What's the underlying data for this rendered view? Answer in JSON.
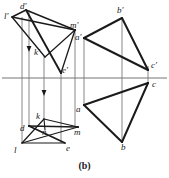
{
  "figure": {
    "caption": "(b)",
    "colors": {
      "ink": "#1a1a1a",
      "thin_line": "#555555",
      "ground_line": "#777777",
      "background": "#ffffff"
    },
    "ground_line": {
      "name": "XY ground line",
      "y": 78,
      "x1": 2,
      "x2": 167
    },
    "labels": [
      {
        "id": "d-prime",
        "text": "d'",
        "x": 20,
        "y": 4
      },
      {
        "id": "l-prime",
        "text": "l'",
        "x": 5,
        "y": 14
      },
      {
        "id": "m-prime",
        "text": "m'",
        "x": 71,
        "y": 24
      },
      {
        "id": "a-prime",
        "text": "a'",
        "x": 76,
        "y": 36
      },
      {
        "id": "b-prime",
        "text": "b'",
        "x": 117,
        "y": 8
      },
      {
        "id": "c-prime",
        "text": "c'",
        "x": 150,
        "y": 63
      },
      {
        "id": "k-prime",
        "text": "k'",
        "x": 35,
        "y": 51
      },
      {
        "id": "e-prime",
        "text": "e'",
        "x": 62,
        "y": 68
      },
      {
        "id": "c",
        "text": "c",
        "x": 151,
        "y": 82
      },
      {
        "id": "a",
        "text": "a",
        "x": 77,
        "y": 107
      },
      {
        "id": "b",
        "text": "b",
        "x": 122,
        "y": 145
      },
      {
        "id": "k",
        "text": "k",
        "x": 36,
        "y": 117
      },
      {
        "id": "d",
        "text": "d",
        "x": 21,
        "y": 127
      },
      {
        "id": "n",
        "text": "n",
        "x": 42,
        "y": 130
      },
      {
        "id": "m",
        "text": "m",
        "x": 72,
        "y": 130
      },
      {
        "id": "l",
        "text": "l",
        "x": 14,
        "y": 148
      },
      {
        "id": "e",
        "text": "e",
        "x": 66,
        "y": 146
      }
    ],
    "geometry": {
      "front_view_plane": {
        "name": "front view of plane figure d'l'm'e'",
        "points": "25,10 61,73 75,30 25,10"
      },
      "front_view_edges": [
        {
          "name": "edge-l-prime-to-m-prime",
          "x1": 12,
          "y1": 17,
          "x2": 75,
          "y2": 30
        },
        {
          "name": "edge-d-prime-to-e-prime",
          "x1": 25,
          "y1": 10,
          "x2": 61,
          "y2": 73
        },
        {
          "name": "edge-e-prime-to-m-prime",
          "x1": 61,
          "y1": 73,
          "x2": 75,
          "y2": 30
        },
        {
          "name": "edge-d-prime-to-m-prime",
          "x1": 25,
          "y1": 10,
          "x2": 75,
          "y2": 30
        },
        {
          "name": "edge-l-prime-to-d-prime",
          "x1": 12,
          "y1": 17,
          "x2": 25,
          "y2": 10
        },
        {
          "name": "edge-l-prime-to-k-prime",
          "x1": 12,
          "y1": 17,
          "x2": 44,
          "y2": 56
        }
      ],
      "top_view_plane": {
        "name": "top view of plane figure d l m e",
        "edges": [
          {
            "name": "edge-d-to-m",
            "x1": 29,
            "y1": 127,
            "x2": 78,
            "y2": 127
          },
          {
            "name": "edge-d-to-e",
            "x1": 29,
            "y1": 127,
            "x2": 65,
            "y2": 143
          },
          {
            "name": "edge-l-to-m",
            "x1": 22,
            "y1": 143,
            "x2": 78,
            "y2": 127
          },
          {
            "name": "edge-l-to-e",
            "x1": 22,
            "y1": 143,
            "x2": 65,
            "y2": 143
          },
          {
            "name": "edge-k-to-m",
            "x1": 44,
            "y1": 120,
            "x2": 78,
            "y2": 127
          },
          {
            "name": "edge-k-to-l",
            "x1": 44,
            "y1": 120,
            "x2": 22,
            "y2": 143
          },
          {
            "name": "edge-k-to-n",
            "x1": 44,
            "y1": 120,
            "x2": 44,
            "y2": 129
          }
        ]
      },
      "projection_lines": [
        {
          "name": "projector-l",
          "x": 22,
          "y1": 17,
          "y2": 143
        },
        {
          "name": "projector-d",
          "x": 29,
          "y1": 10,
          "y2": 127
        },
        {
          "name": "projector-k",
          "x": 44,
          "y1": 56,
          "y2": 120
        },
        {
          "name": "projector-e",
          "x": 61,
          "y1": 73,
          "y2": 143
        },
        {
          "name": "projector-m",
          "x": 75,
          "y1": 30,
          "y2": 127
        },
        {
          "name": "projector-a",
          "x": 84,
          "y1": 38,
          "y2": 105
        },
        {
          "name": "projector-b",
          "x": 122,
          "y1": 18,
          "y2": 142
        },
        {
          "name": "projector-c",
          "x": 148,
          "y1": 70,
          "y2": 82
        }
      ],
      "arrows": [
        {
          "name": "arrow-down-left",
          "x": 29,
          "y": 48
        },
        {
          "name": "arrow-down-middle",
          "x": 44,
          "y": 92
        }
      ],
      "front_triangle": {
        "name": "front view triangle a'b'c'",
        "points": "84,38 122,18 148,70",
        "vertices": {
          "a": [
            84,
            38
          ],
          "b": [
            122,
            18
          ],
          "c": [
            148,
            70
          ]
        }
      },
      "top_triangle": {
        "name": "top view triangle abc",
        "points": "84,105 122,142 148,82",
        "vertices": {
          "a": [
            84,
            105
          ],
          "b": [
            122,
            142
          ],
          "c": [
            148,
            82
          ]
        }
      }
    }
  }
}
